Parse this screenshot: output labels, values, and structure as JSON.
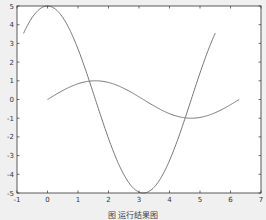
{
  "figure": {
    "background": "#f0f0f0",
    "axes_background": "#ffffff",
    "frame_color": "#333333",
    "curve_color": "#777777",
    "caption": "图  运行结果图"
  },
  "chart_data": {
    "type": "line",
    "title": "",
    "xlabel": "",
    "ylabel": "",
    "xlim": [
      -1,
      7
    ],
    "ylim": [
      -5,
      5
    ],
    "xticks": [
      -1,
      0,
      1,
      2,
      3,
      4,
      5,
      6,
      7
    ],
    "yticks": [
      -5,
      -4,
      -3,
      -2,
      -1,
      0,
      1,
      2,
      3,
      4,
      5
    ],
    "grid": false,
    "legend": null,
    "series": [
      {
        "name": "5*cos(x)",
        "x_range": [
          -0.785,
          5.5
        ],
        "x": [
          -0.785,
          0,
          0.5,
          1.0,
          1.5,
          2.0,
          2.5,
          3.14,
          3.5,
          4.0,
          4.5,
          5.0,
          5.5
        ],
        "y": [
          3.54,
          5.0,
          4.39,
          2.7,
          0.35,
          -2.08,
          -4.01,
          -5.0,
          -4.68,
          -3.27,
          -1.05,
          1.42,
          3.54
        ]
      },
      {
        "name": "sin(x)",
        "x_range": [
          0,
          6.283
        ],
        "x": [
          0,
          0.785,
          1.571,
          2.356,
          3.142,
          3.927,
          4.712,
          5.498,
          6.283
        ],
        "y": [
          0,
          0.71,
          1.0,
          0.71,
          0,
          -0.71,
          -1.0,
          -0.71,
          0
        ]
      }
    ]
  }
}
